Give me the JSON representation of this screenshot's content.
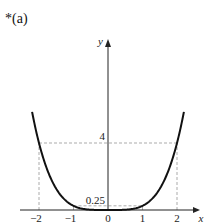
{
  "part_label": "*(a)",
  "chart_data": {
    "type": "line",
    "title": "",
    "function": "y = x^4 / 4",
    "xlabel": "x",
    "ylabel": "y",
    "x_ticks": [
      "-2",
      "-1",
      "0",
      "1",
      "2"
    ],
    "y_ticks": [
      "0.25",
      "4"
    ],
    "xlim": [
      -2.15,
      2.15
    ],
    "ylim": [
      0,
      7.5
    ],
    "grid": false,
    "guide_lines": [
      {
        "from": [
          -2,
          0
        ],
        "to": [
          -2,
          4
        ],
        "style": "dashed"
      },
      {
        "from": [
          2,
          0
        ],
        "to": [
          2,
          4
        ],
        "style": "dashed"
      },
      {
        "from": [
          -2,
          4
        ],
        "to": [
          2,
          4
        ],
        "style": "dashed"
      },
      {
        "from": [
          -1,
          0
        ],
        "to": [
          -1,
          0.25
        ],
        "style": "dashed"
      },
      {
        "from": [
          1,
          0
        ],
        "to": [
          1,
          0.25
        ],
        "style": "dashed"
      },
      {
        "from": [
          -1,
          0.25
        ],
        "to": [
          1,
          0.25
        ],
        "style": "dashed"
      }
    ],
    "series": [
      {
        "name": "y = x^4/4",
        "x": [
          -2.15,
          -2,
          -1.5,
          -1,
          -0.5,
          0,
          0.5,
          1,
          1.5,
          2,
          2.15
        ],
        "y": [
          5.34,
          4,
          1.27,
          0.25,
          0.016,
          0,
          0.016,
          0.25,
          1.27,
          4,
          5.34
        ]
      }
    ]
  }
}
